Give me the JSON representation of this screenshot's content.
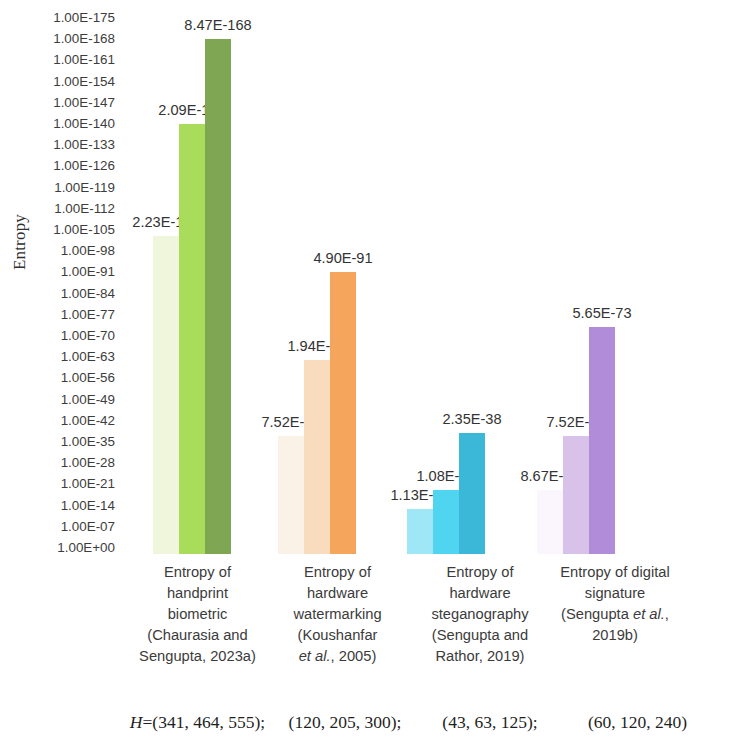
{
  "chart_data": {
    "type": "bar",
    "title": "",
    "xlabel": "",
    "ylabel": "Entropy",
    "yscale": "log",
    "ylim": [
      "1.00E+00",
      "1.00E-175"
    ],
    "grid": false,
    "legend": "none",
    "y_ticks": [
      "1.00E-175",
      "1.00E-168",
      "1.00E-161",
      "1.00E-154",
      "1.00E-147",
      "1.00E-140",
      "1.00E-133",
      "1.00E-126",
      "1.00E-119",
      "1.00E-112",
      "1.00E-105",
      "1.00E-98",
      "1.00E-91",
      "1.00E-84",
      "1.00E-77",
      "1.00E-70",
      "1.00E-63",
      "1.00E-56",
      "1.00E-49",
      "1.00E-42",
      "1.00E-35",
      "1.00E-28",
      "1.00E-21",
      "1.00E-14",
      "1.00E-07",
      "1.00E+00"
    ],
    "y_tick_exponents": [
      -175,
      -168,
      -161,
      -154,
      -147,
      -140,
      -133,
      -126,
      -119,
      -112,
      -105,
      -98,
      -91,
      -84,
      -77,
      -70,
      -63,
      -56,
      -49,
      -42,
      -35,
      -28,
      -21,
      -14,
      -7,
      0
    ],
    "categories": [
      {
        "id": "handprint-biometric",
        "lines": [
          "Entropy of",
          "handprint",
          "biometric",
          "(Chaurasia and",
          "Sengupta, 2023a)"
        ],
        "h_values": "H=(341, 464, 555);",
        "h_prefix": "H",
        "h_rest": "=(341, 464, 555);",
        "colors": [
          "#F0F6DB",
          "#AADC5C",
          "#7FA653"
        ],
        "bars": [
          {
            "label": "2.23E-103",
            "exponent": -103,
            "mantissa": 2.23
          },
          {
            "label": "2.09E-140",
            "exponent": -140,
            "mantissa": 2.09
          },
          {
            "label": "8.47E-168",
            "exponent": -168,
            "mantissa": 8.47
          }
        ]
      },
      {
        "id": "hardware-watermarking",
        "lines": [
          "Entropy of",
          "hardware",
          "watermarking",
          "(Koushanfar",
          "et al., 2005)"
        ],
        "italic_line_index": 4,
        "italic_part": "et al.",
        "h_values": "(120, 205, 300);",
        "colors": [
          "#FAF2E6",
          "#F9DCBE",
          "#F5A55C"
        ],
        "bars": [
          {
            "label": "7.52E-37",
            "exponent": -37,
            "mantissa": 7.52
          },
          {
            "label": "1.94E-62",
            "exponent": -62,
            "mantissa": 1.94
          },
          {
            "label": "4.90E-91",
            "exponent": -91,
            "mantissa": 4.9
          }
        ]
      },
      {
        "id": "hardware-steganography",
        "lines": [
          "Entropy of",
          "hardware",
          "steganography",
          "(Sengupta and",
          "Rathor, 2019)"
        ],
        "h_values": "(43, 63, 125);",
        "colors": [
          "#9FE6F6",
          "#4FD5F0",
          "#3BB8D8"
        ],
        "bars": [
          {
            "label": "1.13E-13",
            "exponent": -13,
            "mantissa": 1.13
          },
          {
            "label": "1.08E-19",
            "exponent": -19,
            "mantissa": 1.08
          },
          {
            "label": "2.35E-38",
            "exponent": -38,
            "mantissa": 2.35
          }
        ]
      },
      {
        "id": "digital-signature",
        "lines": [
          "Entropy of digital",
          "signature",
          "(Sengupta et al.,",
          "2019b)"
        ],
        "italic_line_index": 2,
        "italic_part": "et al.",
        "h_values": "(60, 120, 240)",
        "colors": [
          "#FBF6FD",
          "#D8C2EA",
          "#B08CD9"
        ],
        "bars": [
          {
            "label": "8.67E-19",
            "exponent": -19,
            "mantissa": 8.67
          },
          {
            "label": "7.52E-37",
            "exponent": -37,
            "mantissa": 7.52
          },
          {
            "label": "5.65E-73",
            "exponent": -73,
            "mantissa": 5.65
          }
        ]
      }
    ]
  },
  "axis": {
    "y_title": "Entropy"
  },
  "footer": {
    "h_label_prefix": "H",
    "h_label_suffix": "="
  }
}
